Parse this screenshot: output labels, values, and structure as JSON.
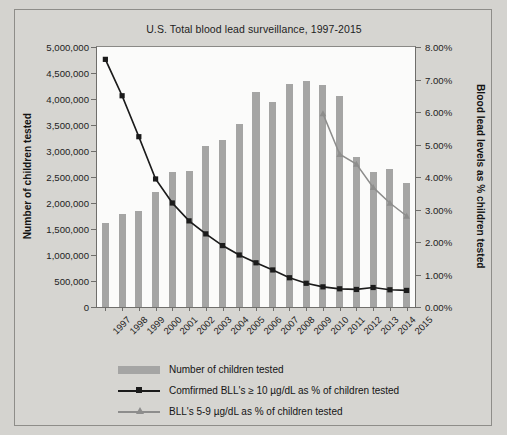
{
  "chart_data": {
    "type": "bar",
    "title": "U.S. Total blood lead surveillance, 1997-2015",
    "xlabel": "",
    "ylabel": "Number of children tested",
    "ylabel_secondary": "Blood lead levels as % children tested",
    "categories": [
      "1997",
      "1998",
      "1999",
      "2000",
      "2001",
      "2002",
      "2003",
      "2004",
      "2005",
      "2006",
      "2007",
      "2008",
      "2009",
      "2010",
      "2011",
      "2012",
      "2013",
      "2014",
      "2015"
    ],
    "ylim": [
      0,
      5000000
    ],
    "ylim_secondary": [
      0,
      0.08
    ],
    "ytick_labels": [
      "0",
      "500,000",
      "1,000,000",
      "1,500,000",
      "2,000,000",
      "2,500,000",
      "3,000,000",
      "3,500,000",
      "4,000,000",
      "4,500,000",
      "5,000,000"
    ],
    "ytick_values": [
      0,
      500000,
      1000000,
      1500000,
      2000000,
      2500000,
      3000000,
      3500000,
      4000000,
      4500000,
      5000000
    ],
    "ytick_labels_secondary": [
      "0.00%",
      "1.00%",
      "2.00%",
      "3.00%",
      "4.00%",
      "5.00%",
      "6.00%",
      "7.00%",
      "8.00%"
    ],
    "ytick_values_secondary": [
      0,
      0.01,
      0.02,
      0.03,
      0.04,
      0.05,
      0.06,
      0.07,
      0.08
    ],
    "grid": false,
    "legend_position": "bottom",
    "series": [
      {
        "name": "Number of children tested",
        "type": "bar",
        "axis": "left",
        "color": "#a5a5a4",
        "values": [
          1610000,
          1790000,
          1840000,
          2220000,
          2600000,
          2620000,
          3090000,
          3220000,
          3520000,
          4140000,
          3950000,
          4280000,
          4350000,
          4260000,
          4050000,
          2890000,
          2600000,
          2650000,
          2390000
        ]
      },
      {
        "name": "Comfirmed BLL's ≥ 10 µg/dL as % of children tested",
        "type": "line",
        "axis": "right",
        "color": "#1b1b1b",
        "marker": "square",
        "values": [
          0.0762,
          0.065,
          0.0524,
          0.0394,
          0.032,
          0.0265,
          0.0225,
          0.0189,
          0.016,
          0.0136,
          0.0114,
          0.009,
          0.0073,
          0.0062,
          0.0056,
          0.0054,
          0.006,
          0.0053,
          0.0051
        ]
      },
      {
        "name": "BLL's 5-9 µg/dL as % of children tested",
        "type": "line",
        "axis": "right",
        "color": "#8d8d8c",
        "marker": "triangle",
        "values": [
          null,
          null,
          null,
          null,
          null,
          null,
          null,
          null,
          null,
          null,
          null,
          null,
          null,
          0.0595,
          0.047,
          0.044,
          0.0368,
          0.032,
          0.028
        ]
      }
    ]
  },
  "legend": {
    "items": [
      {
        "label": "Number of children tested",
        "key": "bar-swatch"
      },
      {
        "label": "Comfirmed BLL's ≥ 10 µg/dL as % of children tested",
        "key": "line-square"
      },
      {
        "label": "BLL's 5-9 µg/dL as % of children tested",
        "key": "line-triangle"
      }
    ]
  },
  "colors": {
    "bar": "#a5a5a4",
    "line_confirmed": "#1b1b1b",
    "line_bll59": "#8d8d8c",
    "background": "#d6d5d1",
    "plot_background": "#fbfbfa"
  }
}
